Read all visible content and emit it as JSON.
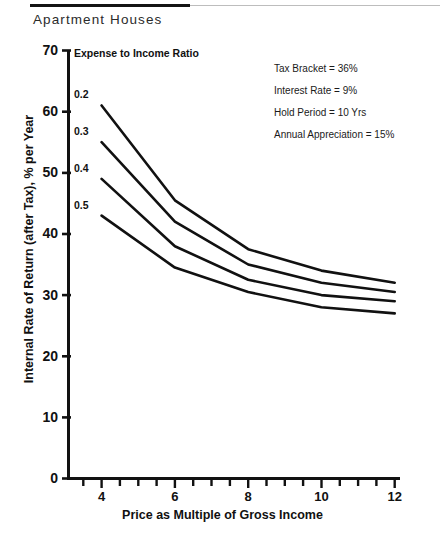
{
  "header": {
    "title": "Apartment Houses"
  },
  "legend": {
    "title": "Expense to Income Ratio",
    "entries": [
      {
        "label": "0.2"
      },
      {
        "label": "0.3"
      },
      {
        "label": "0.4"
      },
      {
        "label": "0.5"
      }
    ]
  },
  "annotations": [
    {
      "text": "Tax Bracket = 36%"
    },
    {
      "text": "Interest Rate = 9%"
    },
    {
      "text": "Hold Period = 10 Yrs"
    },
    {
      "text": "Annual Appreciation = 15%"
    }
  ],
  "axes": {
    "x_title": "Price as Multiple of Gross Income",
    "y_title": "Internal Rate of Return (after Tax), % per Year",
    "x_ticks": [
      "4",
      "6",
      "8",
      "10",
      "12"
    ],
    "y_ticks": [
      "0",
      "10",
      "20",
      "30",
      "40",
      "50",
      "60",
      "70"
    ]
  },
  "colors": {
    "line": "#111111",
    "axis": "#111111",
    "background": "#ffffff",
    "header_rule": "#141414"
  },
  "chart_data": {
    "type": "line",
    "title": "Apartment Houses",
    "subtitle": "Expense to Income Ratio",
    "xlabel": "Price as Multiple of Gross Income",
    "ylabel": "Internal Rate of Return (after Tax), % per Year",
    "xlim": [
      3,
      12
    ],
    "ylim": [
      0,
      70
    ],
    "x_ticks": [
      4,
      6,
      8,
      10,
      12
    ],
    "x_minor_tick_step": 0.5,
    "y_ticks": [
      0,
      10,
      20,
      30,
      40,
      50,
      60,
      70
    ],
    "grid": false,
    "legend": "inline-left-labels",
    "x": [
      4,
      6,
      8,
      10,
      12
    ],
    "series": [
      {
        "name": "0.2",
        "values": [
          61.0,
          45.5,
          37.5,
          34.0,
          32.0
        ]
      },
      {
        "name": "0.3",
        "values": [
          55.0,
          42.0,
          35.0,
          32.0,
          30.5
        ]
      },
      {
        "name": "0.4",
        "values": [
          49.0,
          38.0,
          32.5,
          30.0,
          29.0
        ]
      },
      {
        "name": "0.5",
        "values": [
          43.0,
          34.5,
          30.5,
          28.0,
          27.0
        ]
      }
    ]
  }
}
